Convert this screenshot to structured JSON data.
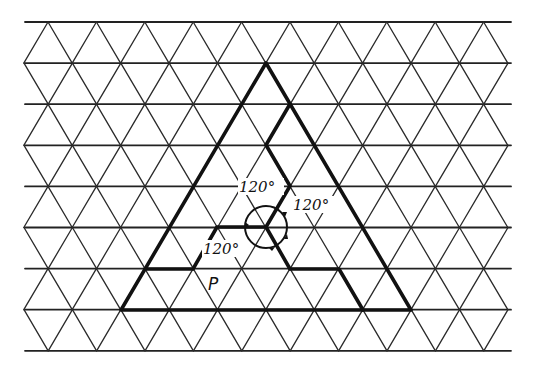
{
  "diagram": {
    "title": "",
    "grid": {
      "type": "triangular-lattice",
      "rows": 8,
      "row_spacing_px": 41.1,
      "column_spacing_px": 48.4,
      "x_min": 23,
      "x_max": 513,
      "y_top": 22,
      "stroke_color": "#2a2a2a"
    },
    "big_triangle": {
      "apex": [
        266,
        63
      ],
      "base_left": [
        121,
        310
      ],
      "base_right": [
        411,
        310
      ],
      "stroke_color": "#111111"
    },
    "center_point": [
      266,
      227
    ],
    "angle_labels": [
      {
        "text": "120°",
        "position": "upper-left"
      },
      {
        "text": "120°",
        "position": "right"
      },
      {
        "text": "120°",
        "position": "lower-left"
      }
    ],
    "region_label": {
      "text": "P"
    },
    "rotation_indicator": {
      "arrows": 3,
      "description": "circular arrows around center showing 120° rotation"
    }
  }
}
